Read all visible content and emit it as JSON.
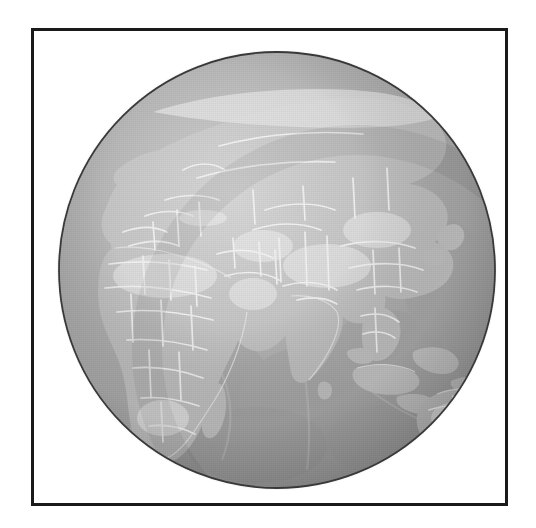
{
  "figure": {
    "title": "Orthographic globe, Eastern Hemisphere",
    "caption": "",
    "background_color": "#ffffff"
  },
  "frame": {
    "border_color": "#1a1a1a",
    "border_width_px": 3,
    "x": 31,
    "y": 28,
    "width": 477,
    "height": 478
  },
  "globe": {
    "projection": "orthographic",
    "center_longitude_deg": 75,
    "center_latitude_deg": 22,
    "center_x_px": 274,
    "center_y_px": 267,
    "radius_px": 220,
    "outline_color": "#3a3a3a",
    "ocean_color": "#a9a9a9",
    "land_color": "#bdbdbd",
    "land_highlight_color": "#d8d8d8",
    "border_line_color": "#f2f2f2",
    "shallow_water_color": "#c9c9c9",
    "shadow_color": "#8f8f8f",
    "grayscale": true
  },
  "regions": [
    {
      "name": "Europe"
    },
    {
      "name": "Africa"
    },
    {
      "name": "Arabian Peninsula"
    },
    {
      "name": "Central Asia"
    },
    {
      "name": "Siberia"
    },
    {
      "name": "India"
    },
    {
      "name": "East Asia"
    },
    {
      "name": "Southeast Asia"
    },
    {
      "name": "Indonesia"
    },
    {
      "name": "Australia"
    },
    {
      "name": "Madagascar"
    },
    {
      "name": "Indian Ocean"
    },
    {
      "name": "Arctic Ocean"
    }
  ],
  "legend": {
    "visible": false,
    "entries": []
  },
  "labels": {
    "visible": false,
    "items": []
  },
  "scalebar": {
    "visible": false,
    "text": ""
  }
}
